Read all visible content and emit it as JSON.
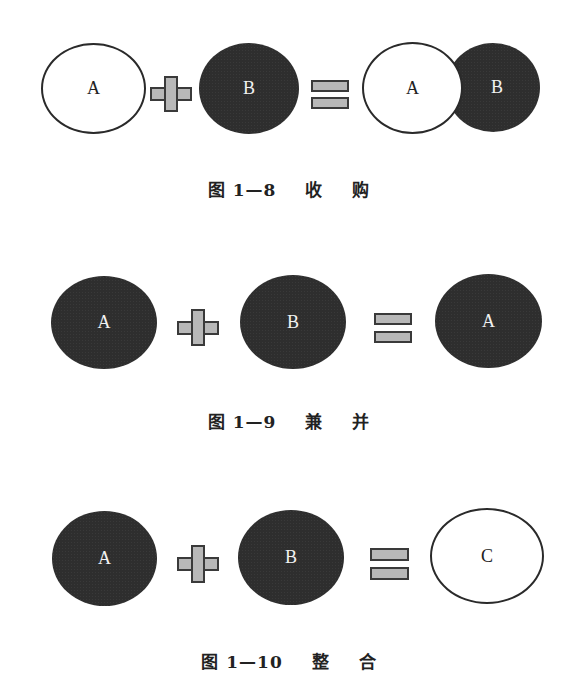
{
  "colors": {
    "white_fill": "#ffffff",
    "dark_fill": "#2e2e2e",
    "operator_fill": "#b8b8b8",
    "outline": "#2a2a2a"
  },
  "figures": [
    {
      "id": "fig-1-8",
      "left": [
        {
          "label": "A",
          "fill": "white"
        }
      ],
      "operator": "plus",
      "right": [
        {
          "label": "B",
          "fill": "dark"
        }
      ],
      "result_operator": "equals",
      "result": [
        {
          "label": "A",
          "fill": "white"
        },
        {
          "label": "B",
          "fill": "dark"
        }
      ],
      "caption": {
        "prefix": "图",
        "number": "1—8",
        "word1": "收",
        "word2": "购"
      }
    },
    {
      "id": "fig-1-9",
      "left": [
        {
          "label": "A",
          "fill": "dark"
        }
      ],
      "operator": "plus",
      "right": [
        {
          "label": "B",
          "fill": "dark"
        }
      ],
      "result_operator": "equals",
      "result": [
        {
          "label": "A",
          "fill": "dark"
        }
      ],
      "caption": {
        "prefix": "图",
        "number": "1—9",
        "word1": "兼",
        "word2": "并"
      }
    },
    {
      "id": "fig-1-10",
      "left": [
        {
          "label": "A",
          "fill": "dark"
        }
      ],
      "operator": "plus",
      "right": [
        {
          "label": "B",
          "fill": "dark"
        }
      ],
      "result_operator": "equals",
      "result": [
        {
          "label": "C",
          "fill": "white"
        }
      ],
      "caption": {
        "prefix": "图",
        "number": "1—10",
        "word1": "整",
        "word2": "合"
      }
    }
  ]
}
